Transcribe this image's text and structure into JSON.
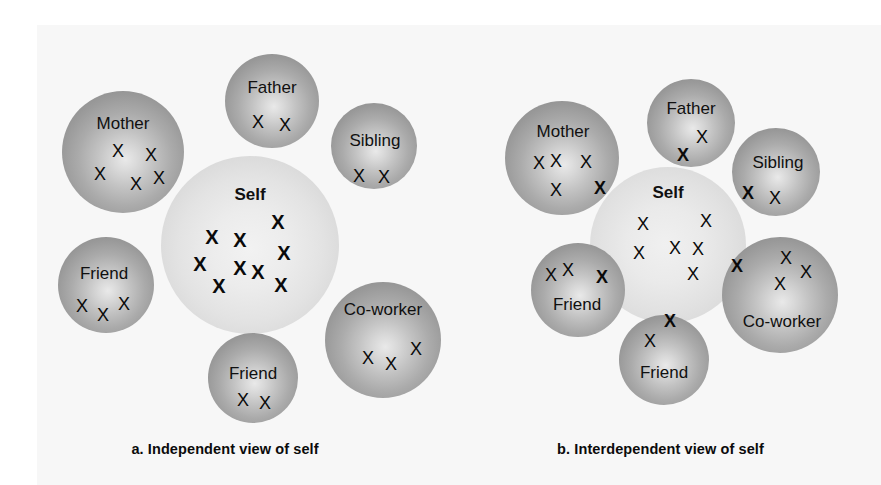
{
  "figure": {
    "mark_glyph": "X",
    "self_label": "Self",
    "colors": {
      "sphere_outer": "#868686",
      "sphere_highlight": "#e9e9e9",
      "self_fill": "#e6e6e6",
      "mark": "#0a0a0a",
      "background": "#ffffff",
      "page_tint": "#f7f7f7"
    }
  },
  "panels": [
    {
      "id": "a",
      "caption": "a. Independent view of self",
      "self": {
        "label": "Self",
        "x": 250,
        "y": 245,
        "r": 89,
        "marks": [
          {
            "g": "X",
            "w": "bold",
            "x": 212,
            "y": 237
          },
          {
            "g": "X",
            "w": "bold",
            "x": 240,
            "y": 240
          },
          {
            "g": "X",
            "w": "bold",
            "x": 278,
            "y": 222
          },
          {
            "g": "X",
            "w": "bold",
            "x": 284,
            "y": 253
          },
          {
            "g": "X",
            "w": "bold",
            "x": 200,
            "y": 264
          },
          {
            "g": "X",
            "w": "bold",
            "x": 240,
            "y": 268
          },
          {
            "g": "X",
            "w": "bold",
            "x": 258,
            "y": 272
          },
          {
            "g": "X",
            "w": "bold",
            "x": 219,
            "y": 286
          },
          {
            "g": "X",
            "w": "bold",
            "x": 281,
            "y": 285
          }
        ]
      },
      "circles": [
        {
          "name": "mother",
          "label": "Mother",
          "x": 123,
          "y": 152,
          "r": 61,
          "label_x": 123,
          "label_y": 124,
          "marks": [
            {
              "g": "X",
              "w": "thin",
              "x": 118,
              "y": 151
            },
            {
              "g": "X",
              "w": "thin",
              "x": 151,
              "y": 155
            },
            {
              "g": "X",
              "w": "thin",
              "x": 100,
              "y": 174
            },
            {
              "g": "X",
              "w": "thin",
              "x": 136,
              "y": 184
            },
            {
              "g": "X",
              "w": "thin",
              "x": 159,
              "y": 178
            }
          ]
        },
        {
          "name": "father",
          "label": "Father",
          "x": 272,
          "y": 101,
          "r": 47,
          "label_x": 272,
          "label_y": 88,
          "marks": [
            {
              "g": "X",
              "w": "thin",
              "x": 258,
              "y": 122
            },
            {
              "g": "X",
              "w": "thin",
              "x": 285,
              "y": 125
            }
          ]
        },
        {
          "name": "sibling",
          "label": "Sibling",
          "x": 374,
          "y": 146,
          "r": 43,
          "label_x": 375,
          "label_y": 141,
          "marks": [
            {
              "g": "X",
              "w": "thin",
              "x": 359,
              "y": 176
            },
            {
              "g": "X",
              "w": "thin",
              "x": 384,
              "y": 177
            }
          ]
        },
        {
          "name": "friend-left",
          "label": "Friend",
          "x": 106,
          "y": 285,
          "r": 48,
          "label_x": 104,
          "label_y": 274,
          "marks": [
            {
              "g": "X",
              "w": "thin",
              "x": 82,
              "y": 306
            },
            {
              "g": "X",
              "w": "thin",
              "x": 103,
              "y": 315
            },
            {
              "g": "X",
              "w": "thin",
              "x": 124,
              "y": 304
            }
          ]
        },
        {
          "name": "friend-bottom",
          "label": "Friend",
          "x": 253,
          "y": 378,
          "r": 45,
          "label_x": 253,
          "label_y": 374,
          "marks": [
            {
              "g": "X",
              "w": "thin",
              "x": 243,
              "y": 400
            },
            {
              "g": "X",
              "w": "thin",
              "x": 265,
              "y": 403
            }
          ]
        },
        {
          "name": "co-worker",
          "label": "Co-worker",
          "x": 383,
          "y": 340,
          "r": 58,
          "label_x": 383,
          "label_y": 310,
          "marks": [
            {
              "g": "X",
              "w": "thin",
              "x": 368,
              "y": 358
            },
            {
              "g": "X",
              "w": "thin",
              "x": 391,
              "y": 364
            },
            {
              "g": "X",
              "w": "thin",
              "x": 416,
              "y": 349
            }
          ]
        }
      ]
    },
    {
      "id": "b",
      "caption": "b. Interdependent view of self",
      "self": {
        "label": "Self",
        "x": 668,
        "y": 245,
        "r": 78,
        "label_x": 668,
        "label_y": 193,
        "marks": [
          {
            "g": "X",
            "w": "thin",
            "x": 643,
            "y": 224
          },
          {
            "g": "X",
            "w": "thin",
            "x": 706,
            "y": 221
          },
          {
            "g": "X",
            "w": "thin",
            "x": 639,
            "y": 253
          },
          {
            "g": "X",
            "w": "thin",
            "x": 675,
            "y": 248
          },
          {
            "g": "X",
            "w": "thin",
            "x": 698,
            "y": 249
          },
          {
            "g": "X",
            "w": "thin",
            "x": 693,
            "y": 274
          }
        ]
      },
      "circles": [
        {
          "name": "mother",
          "label": "Mother",
          "x": 562,
          "y": 158,
          "r": 57,
          "label_x": 563,
          "label_y": 132,
          "marks": [
            {
              "g": "X",
              "w": "thin",
              "x": 539,
              "y": 163
            },
            {
              "g": "X",
              "w": "thin",
              "x": 556,
              "y": 161
            },
            {
              "g": "X",
              "w": "thin",
              "x": 586,
              "y": 162
            },
            {
              "g": "X",
              "w": "thin",
              "x": 556,
              "y": 190
            },
            {
              "g": "X",
              "w": "bold-sm",
              "x": 600,
              "y": 188
            }
          ]
        },
        {
          "name": "father",
          "label": "Father",
          "x": 691,
          "y": 123,
          "r": 44,
          "label_x": 691,
          "label_y": 109,
          "marks": [
            {
              "g": "X",
              "w": "thin",
              "x": 702,
              "y": 137
            },
            {
              "g": "X",
              "w": "bold-sm",
              "x": 683,
              "y": 155
            }
          ]
        },
        {
          "name": "sibling",
          "label": "Sibling",
          "x": 776,
          "y": 172,
          "r": 44,
          "label_x": 778,
          "label_y": 163,
          "marks": [
            {
              "g": "X",
              "w": "bold-sm",
              "x": 748,
              "y": 193
            },
            {
              "g": "X",
              "w": "thin",
              "x": 775,
              "y": 198
            }
          ]
        },
        {
          "name": "friend-left",
          "label": "Friend",
          "x": 578,
          "y": 290,
          "r": 47,
          "label_x": 577,
          "label_y": 305,
          "marks": [
            {
              "g": "X",
              "w": "thin",
              "x": 551,
              "y": 275
            },
            {
              "g": "X",
              "w": "thin",
              "x": 568,
              "y": 270
            },
            {
              "g": "X",
              "w": "bold-sm",
              "x": 602,
              "y": 277
            }
          ]
        },
        {
          "name": "friend-bottom",
          "label": "Friend",
          "x": 664,
          "y": 360,
          "r": 45,
          "label_x": 664,
          "label_y": 373,
          "marks": [
            {
              "g": "X",
              "w": "bold-sm",
              "x": 670,
              "y": 321
            },
            {
              "g": "X",
              "w": "thin",
              "x": 650,
              "y": 341
            }
          ]
        },
        {
          "name": "co-worker",
          "label": "Co-worker",
          "x": 780,
          "y": 295,
          "r": 58,
          "label_x": 782,
          "label_y": 322,
          "marks": [
            {
              "g": "X",
              "w": "bold-sm",
              "x": 737,
              "y": 266
            },
            {
              "g": "X",
              "w": "thin",
              "x": 786,
              "y": 258
            },
            {
              "g": "X",
              "w": "thin",
              "x": 806,
              "y": 272
            },
            {
              "g": "X",
              "w": "thin",
              "x": 780,
              "y": 284
            }
          ]
        }
      ]
    }
  ]
}
